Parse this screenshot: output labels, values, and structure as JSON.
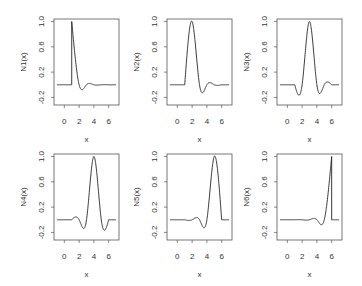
{
  "figure": {
    "layout": "2 rows x 3 columns",
    "panels_count": 6
  },
  "chart_data": [
    {
      "type": "line",
      "title": "",
      "xlabel": "x",
      "ylabel": "N1(x)",
      "xlim": [
        -1.4,
        7.4
      ],
      "ylim": [
        -0.32,
        1.04
      ],
      "xticks": [
        0,
        2,
        4,
        6
      ],
      "yticks": [
        1.0,
        0.6,
        0.2,
        -0.2
      ],
      "ytick_labels": [
        "1.0",
        "0.6",
        "0.2",
        "-0.2"
      ],
      "index": 0,
      "peak": {
        "x": 1,
        "y": 1.0
      },
      "support": [
        1,
        6
      ],
      "grid": false,
      "legend": null
    },
    {
      "type": "line",
      "title": "",
      "xlabel": "x",
      "ylabel": "N2(x)",
      "xlim": [
        -1.4,
        7.4
      ],
      "ylim": [
        -0.32,
        1.04
      ],
      "xticks": [
        0,
        2,
        4,
        6
      ],
      "yticks": [
        1.0,
        0.6,
        0.2,
        -0.2
      ],
      "ytick_labels": [
        "1.0",
        "0.6",
        "0.2",
        "-0.2"
      ],
      "index": 1,
      "peak": {
        "x": 2,
        "y": 1.0
      },
      "support": [
        1,
        6
      ],
      "grid": false,
      "legend": null
    },
    {
      "type": "line",
      "title": "",
      "xlabel": "x",
      "ylabel": "N3(x)",
      "xlim": [
        -1.4,
        7.4
      ],
      "ylim": [
        -0.32,
        1.04
      ],
      "xticks": [
        0,
        2,
        4,
        6
      ],
      "yticks": [
        1.0,
        0.6,
        0.2,
        -0.2
      ],
      "ytick_labels": [
        "1.0",
        "0.6",
        "0.2",
        "-0.2"
      ],
      "index": 2,
      "peak": {
        "x": 3,
        "y": 1.0
      },
      "support": [
        1,
        6
      ],
      "grid": false,
      "legend": null
    },
    {
      "type": "line",
      "title": "",
      "xlabel": "x",
      "ylabel": "N4(x)",
      "xlim": [
        -1.4,
        7.4
      ],
      "ylim": [
        -0.32,
        1.04
      ],
      "xticks": [
        0,
        2,
        4,
        6
      ],
      "yticks": [
        1.0,
        0.6,
        0.2,
        -0.2
      ],
      "ytick_labels": [
        "1.0",
        "0.6",
        "0.2",
        "-0.2"
      ],
      "index": 3,
      "peak": {
        "x": 4,
        "y": 1.0
      },
      "support": [
        1,
        6
      ],
      "grid": false,
      "legend": null
    },
    {
      "type": "line",
      "title": "",
      "xlabel": "x",
      "ylabel": "N5(x)",
      "xlim": [
        -1.4,
        7.4
      ],
      "ylim": [
        -0.32,
        1.04
      ],
      "xticks": [
        0,
        2,
        4,
        6
      ],
      "yticks": [
        1.0,
        0.6,
        0.2,
        -0.2
      ],
      "ytick_labels": [
        "1.0",
        "0.6",
        "0.2",
        "-0.2"
      ],
      "index": 4,
      "peak": {
        "x": 5,
        "y": 1.0
      },
      "support": [
        1,
        6
      ],
      "grid": false,
      "legend": null
    },
    {
      "type": "line",
      "title": "",
      "xlabel": "x",
      "ylabel": "N6(x)",
      "xlim": [
        -1.4,
        7.4
      ],
      "ylim": [
        -0.32,
        1.04
      ],
      "xticks": [
        0,
        2,
        4,
        6
      ],
      "yticks": [
        1.0,
        0.6,
        0.2,
        -0.2
      ],
      "ytick_labels": [
        "1.0",
        "0.6",
        "0.2",
        "-0.2"
      ],
      "index": 5,
      "peak": {
        "x": 6,
        "y": 1.0
      },
      "support": [
        1,
        6
      ],
      "grid": false,
      "legend": null
    }
  ],
  "spline": {
    "kind": "natural cubic spline cardinal basis",
    "knots": [
      1,
      2,
      3,
      4,
      5,
      6
    ],
    "plot_x_range": [
      -1,
      7
    ]
  },
  "style": {
    "line_color": "#222222",
    "axis_color": "#555555",
    "text_color": "#333333"
  }
}
